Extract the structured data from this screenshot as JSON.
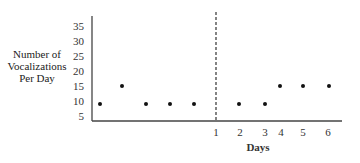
{
  "chart_data": {
    "type": "scatter",
    "title": "",
    "xlabel": "Days",
    "ylabel": "Number of Vocalizations Per Day",
    "ylabel_lines": [
      "Number of",
      "Vocalizations",
      "Per Day"
    ],
    "ylim": [
      5,
      35
    ],
    "yticks": [
      "35",
      "30",
      "25",
      "20",
      "15",
      "10",
      "5"
    ],
    "xticks": [
      "1",
      "2",
      "3",
      "4",
      "5",
      "6"
    ],
    "phase_line": {
      "style": "dashed",
      "position": "before treatment day 1"
    },
    "grid": false,
    "series": [
      {
        "name": "Baseline",
        "x": [
          1,
          2,
          3,
          4,
          5
        ],
        "values": [
          9,
          15,
          9,
          9,
          9
        ]
      },
      {
        "name": "Treatment",
        "x": [
          2,
          3,
          4,
          5,
          6
        ],
        "values": [
          9,
          9,
          15,
          15,
          15
        ]
      }
    ]
  }
}
